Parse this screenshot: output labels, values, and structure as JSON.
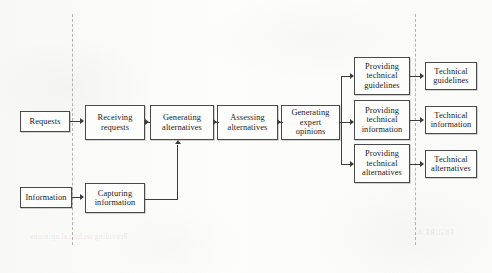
{
  "diagram": {
    "type": "flowchart",
    "orientation": "left-to-right",
    "lanes": [
      {
        "id": "input-lane",
        "name": "Inputs"
      },
      {
        "id": "process-lane",
        "name": "Processes"
      },
      {
        "id": "output-lane",
        "name": "Outputs"
      }
    ],
    "nodes": [
      {
        "id": "requests",
        "lane": "input-lane",
        "lines": [
          "Requests"
        ]
      },
      {
        "id": "information",
        "lane": "input-lane",
        "lines": [
          "Information"
        ]
      },
      {
        "id": "receiving-requests",
        "lane": "process-lane",
        "lines": [
          "Receiving",
          "requests"
        ]
      },
      {
        "id": "capturing-information",
        "lane": "process-lane",
        "lines": [
          "Capturing",
          "information"
        ]
      },
      {
        "id": "generating-alternatives",
        "lane": "process-lane",
        "lines": [
          "Generating",
          "alternatives"
        ]
      },
      {
        "id": "assessing-alternatives",
        "lane": "process-lane",
        "lines": [
          "Assessing",
          "alternatives"
        ]
      },
      {
        "id": "generating-expert-opinions",
        "lane": "process-lane",
        "lines": [
          "Generating",
          "expert opinions"
        ]
      },
      {
        "id": "providing-technical-guidelines",
        "lane": "process-lane",
        "lines": [
          "Providing",
          "technical",
          "guidelines"
        ]
      },
      {
        "id": "providing-technical-information",
        "lane": "process-lane",
        "lines": [
          "Providing",
          "technical",
          "information"
        ]
      },
      {
        "id": "providing-technical-alternatives",
        "lane": "process-lane",
        "lines": [
          "Providing",
          "technical",
          "alternatives"
        ]
      },
      {
        "id": "technical-guidelines",
        "lane": "output-lane",
        "lines": [
          "Technical",
          "guidelines"
        ]
      },
      {
        "id": "technical-information",
        "lane": "output-lane",
        "lines": [
          "Technical",
          "information"
        ]
      },
      {
        "id": "technical-alternatives",
        "lane": "output-lane",
        "lines": [
          "Technical",
          "alternatives"
        ]
      }
    ],
    "edges": [
      {
        "from": "requests",
        "to": "receiving-requests"
      },
      {
        "from": "receiving-requests",
        "to": "generating-alternatives"
      },
      {
        "from": "generating-alternatives",
        "to": "assessing-alternatives"
      },
      {
        "from": "assessing-alternatives",
        "to": "generating-expert-opinions"
      },
      {
        "from": "information",
        "to": "capturing-information"
      },
      {
        "from": "capturing-information",
        "to": "generating-alternatives"
      },
      {
        "from": "generating-expert-opinions",
        "to": "providing-technical-guidelines"
      },
      {
        "from": "generating-expert-opinions",
        "to": "providing-technical-information"
      },
      {
        "from": "generating-expert-opinions",
        "to": "providing-technical-alternatives"
      },
      {
        "from": "providing-technical-guidelines",
        "to": "technical-guidelines"
      },
      {
        "from": "providing-technical-information",
        "to": "technical-information"
      },
      {
        "from": "providing-technical-alternatives",
        "to": "technical-alternatives"
      }
    ]
  },
  "labels": {
    "requests": "Requests",
    "information": "Information",
    "receiving_1": "Receiving",
    "receiving_2": "requests",
    "capturing_1": "Capturing",
    "capturing_2": "information",
    "gen_alt_1": "Generating",
    "gen_alt_2": "alternatives",
    "assess_1": "Assessing",
    "assess_2": "alternatives",
    "gen_exp_1": "Generating",
    "gen_exp_2": "expert opinions",
    "prov_guid_1": "Providing",
    "prov_guid_2": "technical",
    "prov_guid_3": "guidelines",
    "prov_info_1": "Providing",
    "prov_info_2": "technical",
    "prov_info_3": "information",
    "prov_alt_1": "Providing",
    "prov_alt_2": "technical",
    "prov_alt_3": "alternatives",
    "tech_guid_1": "Technical",
    "tech_guid_2": "guidelines",
    "tech_info_1": "Technical",
    "tech_info_2": "information",
    "tech_alt_1": "Technical",
    "tech_alt_2": "alternatives"
  },
  "colors": {
    "page_background": "#fbfbfa",
    "node_fill": "#fdfdfc",
    "node_border": "#4a4a4a",
    "edge": "#3d3d3d",
    "divider": "#b3b3b3",
    "text": "#1b1b1b"
  },
  "bleed_through": {
    "line_a": "Providing technical opinions",
    "line_b": "FIGURE 4"
  }
}
